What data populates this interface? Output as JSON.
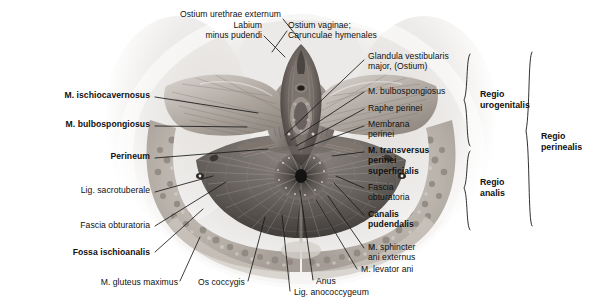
{
  "figure": {
    "background_color": "#ffffff",
    "line_color": "#1a1a1a",
    "text_color": "#111111",
    "width": 602,
    "height": 308
  },
  "labels": {
    "top": [
      {
        "id": "ostium-urethrae-externum",
        "text": "Ostium urethrae externum",
        "bold": false,
        "align": "right",
        "x": 281,
        "y": 14,
        "line": [
          [
            283,
            19
          ],
          [
            300,
            40
          ]
        ]
      },
      {
        "id": "labium-minus-pudendi",
        "text": "Labium\nminus pudendi",
        "bold": false,
        "align": "right",
        "x": 262,
        "y": 25,
        "line": [
          [
            264,
            36
          ],
          [
            285,
            57
          ]
        ]
      },
      {
        "id": "ostium-vaginae-caruncula",
        "text": "Ostium vaginae;\nCarunculae hymenales",
        "bold": false,
        "align": "left",
        "x": 288,
        "y": 25,
        "line": [
          [
            287,
            31
          ],
          [
            272,
            52
          ]
        ]
      }
    ],
    "left": [
      {
        "id": "m-ischiocavernosus",
        "text": "M. ischiocavernosus",
        "bold": true,
        "x": 150,
        "y": 95,
        "line": [
          [
            155,
            97
          ],
          [
            258,
            113
          ]
        ]
      },
      {
        "id": "m-bulbospongiosus-left",
        "text": "M. bulbospongiosus",
        "bold": true,
        "x": 150,
        "y": 124,
        "line": [
          [
            155,
            126
          ],
          [
            247,
            127
          ]
        ]
      },
      {
        "id": "perineum",
        "text": "Perineum",
        "bold": true,
        "x": 150,
        "y": 156,
        "line": [
          [
            155,
            158
          ],
          [
            268,
            149
          ]
        ]
      },
      {
        "id": "lig-sacrotuberale",
        "text": "Lig. sacrotuberale",
        "bold": false,
        "x": 150,
        "y": 190,
        "line": [
          [
            155,
            192
          ],
          [
            213,
            176
          ]
        ]
      },
      {
        "id": "fascia-obturatoria-left",
        "text": "Fascia obturatoria",
        "bold": false,
        "x": 150,
        "y": 225,
        "line": [
          [
            155,
            226
          ],
          [
            226,
            182
          ]
        ]
      },
      {
        "id": "fossa-ischioanalis",
        "text": "Fossa ischioanalis",
        "bold": true,
        "x": 150,
        "y": 252,
        "line": [
          [
            155,
            252
          ],
          [
            203,
            209
          ]
        ]
      },
      {
        "id": "m-gluteus-maximus",
        "text": "M. gluteus maximus",
        "bold": false,
        "x": 178,
        "y": 283,
        "line": [
          [
            180,
            281
          ],
          [
            200,
            237
          ]
        ]
      }
    ],
    "bottom": [
      {
        "id": "os-coccygis",
        "text": "Os coccygis",
        "bold": false,
        "x": 198,
        "y": 283,
        "line": [
          [
            248,
            281
          ],
          [
            265,
            217
          ]
        ]
      },
      {
        "id": "lig-anococcygeum",
        "text": "Lig. anococcygeum",
        "bold": false,
        "x": 258,
        "y": 293,
        "line": [
          [
            290,
            291
          ],
          [
            282,
            215
          ]
        ]
      },
      {
        "id": "anus",
        "text": "Anus",
        "bold": false,
        "x": 310,
        "y": 283,
        "line": [
          [
            313,
            280
          ],
          [
            300,
            190
          ]
        ]
      }
    ],
    "right": [
      {
        "id": "glandula-vestibularis-major",
        "text": "Glandula vestibularis\nmajor, (Ostium)",
        "bold": false,
        "x": 366,
        "y": 55,
        "line": [
          [
            364,
            60
          ],
          [
            285,
            135
          ]
        ]
      },
      {
        "id": "m-bulbospongiosus-right",
        "text": "M. bulbospongiosus",
        "bold": false,
        "x": 366,
        "y": 89,
        "line": [
          [
            364,
            92
          ],
          [
            291,
            140
          ]
        ]
      },
      {
        "id": "raphe-perinei",
        "text": "Raphe perinei",
        "bold": false,
        "x": 366,
        "y": 106,
        "line": [
          [
            364,
            109
          ],
          [
            296,
            146
          ]
        ]
      },
      {
        "id": "membrana-perinei",
        "text": "Membrana\nperinei",
        "bold": false,
        "x": 366,
        "y": 122,
        "line": [
          [
            364,
            126
          ],
          [
            299,
            150
          ]
        ]
      },
      {
        "id": "m-transversus-perinei-superficialis",
        "text": "M. transversus\nperinei\nsuperficialis",
        "bold": true,
        "x": 366,
        "y": 148,
        "line": [
          [
            364,
            152
          ],
          [
            332,
            156
          ]
        ]
      },
      {
        "id": "fascia-obturatoria-right",
        "text": "Fascia\nobturatoria",
        "bold": false,
        "x": 366,
        "y": 185,
        "line": [
          [
            364,
            188
          ],
          [
            336,
            176
          ]
        ]
      },
      {
        "id": "canalis-pudendalis",
        "text": "Canalis\npudendalis",
        "bold": true,
        "x": 366,
        "y": 212,
        "line": [
          [
            364,
            215
          ],
          [
            334,
            183
          ]
        ]
      },
      {
        "id": "m-sphincter-ani-externus",
        "text": "M. sphincter\nani externus",
        "bold": false,
        "x": 366,
        "y": 245,
        "line": [
          [
            364,
            248
          ],
          [
            328,
            196
          ]
        ]
      },
      {
        "id": "m-levator-ani",
        "text": "M. levator ani",
        "bold": false,
        "x": 359,
        "y": 268,
        "line": [
          [
            357,
            269
          ],
          [
            316,
            200
          ]
        ]
      }
    ]
  },
  "regions": [
    {
      "id": "regio-urogenitalis",
      "text": "Regio\nurogenitalis",
      "label_x": 478,
      "label_y": 90,
      "bracket_x": 468,
      "bracket_y0": 52,
      "bracket_y1": 147
    },
    {
      "id": "regio-analis",
      "text": "Regio\nanalis",
      "label_x": 478,
      "label_y": 172,
      "bracket_x": 468,
      "bracket_y0": 149,
      "bracket_y1": 232
    },
    {
      "id": "regio-perinealis",
      "text": "Regio\nperinealis",
      "label_x": 540,
      "label_y": 131,
      "bracket_x": 530,
      "bracket_y0": 50,
      "bracket_y1": 228
    }
  ]
}
